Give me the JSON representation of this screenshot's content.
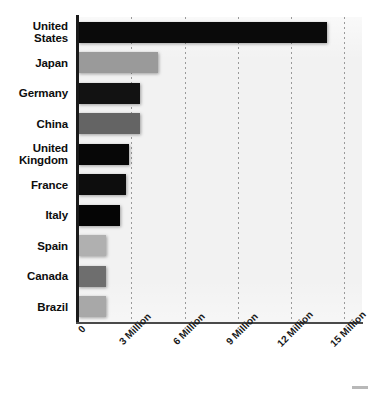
{
  "chart_data": {
    "type": "bar",
    "orientation": "horizontal",
    "title": "",
    "subtitle": "",
    "xlabel": "",
    "ylabel": "",
    "categories": [
      "United\nStates",
      "Japan",
      "Germany",
      "China",
      "United\nKingdom",
      "France",
      "Italy",
      "Spain",
      "Canada",
      "Brazil"
    ],
    "values": [
      14000000,
      4500000,
      3500000,
      3500000,
      2900000,
      2700000,
      2350000,
      1600000,
      1600000,
      1600000
    ],
    "bar_colors": [
      "#0a0a0a",
      "#9a9a9a",
      "#121212",
      "#646464",
      "#070707",
      "#0d0d0d",
      "#050505",
      "#b0b0b0",
      "#6e6e6e",
      "#a8a8a8"
    ],
    "xlim": [
      0,
      16000000
    ],
    "ylim": [
      0,
      10
    ],
    "x_tick_values": [
      0,
      3000000,
      6000000,
      9000000,
      12000000,
      15000000
    ],
    "x_tick_labels": [
      "0",
      "3 Million",
      "6 Million",
      "9 Million",
      "12 Million",
      "15 Million"
    ],
    "grid": "vertical-dotted",
    "legend": "none",
    "plot_background": "#f2f2f2",
    "page_background": "#ffffff",
    "axis_color": "#1a1a1a",
    "gridline_color": "#9a9a9a"
  },
  "figure": {
    "corner_mark": ""
  }
}
